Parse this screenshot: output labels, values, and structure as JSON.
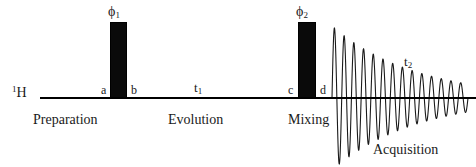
{
  "diagram": {
    "nucleus": "¹H",
    "nucleus_base": "H",
    "nucleus_mass": "1",
    "axis_color": "#000000",
    "pulse_color": "#0a0a0a",
    "background": "#ffffff"
  },
  "pulses": [
    {
      "id": "pulse-1",
      "phase_symbol": "ϕ",
      "phase_index": "1",
      "phase_label": "ϕ1"
    },
    {
      "id": "pulse-2",
      "phase_symbol": "ϕ",
      "phase_index": "2",
      "phase_label": "ϕ2"
    }
  ],
  "markers": [
    {
      "id": "marker-a",
      "label": "a"
    },
    {
      "id": "marker-b",
      "label": "b"
    },
    {
      "id": "marker-c",
      "label": "c"
    },
    {
      "id": "marker-d",
      "label": "d"
    }
  ],
  "times": [
    {
      "id": "time-t1",
      "symbol": "t",
      "index": "1",
      "label": "t1"
    },
    {
      "id": "time-t2",
      "symbol": "t",
      "index": "2",
      "label": "t2"
    }
  ],
  "periods": [
    {
      "id": "period-preparation",
      "label": "Preparation"
    },
    {
      "id": "period-evolution",
      "label": "Evolution"
    },
    {
      "id": "period-mixing",
      "label": "Mixing"
    },
    {
      "id": "period-acquisition",
      "label": "Acquisition"
    }
  ],
  "chart_data": {
    "type": "line",
    "xlabel": "t2",
    "ylabel": "signal",
    "x_start_px": 332,
    "x_end_px": 468,
    "baseline_y_px": 98,
    "amplitude_start": 72,
    "amplitude_end": 14,
    "cycles": 14,
    "decay": "exponential",
    "grid": false,
    "legend": null
  }
}
